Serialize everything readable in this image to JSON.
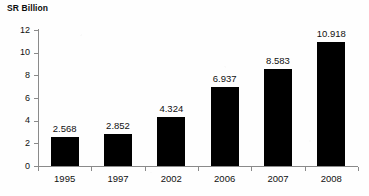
{
  "chart_data": {
    "type": "bar",
    "title": "SR Billion",
    "xlabel": "",
    "ylabel": "SR Billion",
    "categories": [
      "1995",
      "1997",
      "2002",
      "2006",
      "2007",
      "2008"
    ],
    "values": [
      2.568,
      2.852,
      4.324,
      6.937,
      8.583,
      10.918
    ],
    "value_labels": [
      "2.568",
      "2.852",
      "4.324",
      "6.937",
      "8.583",
      "10.918"
    ],
    "ylim": [
      0,
      12
    ],
    "ytick_labels": [
      "0",
      "2",
      "4",
      "6",
      "8",
      "10",
      "12"
    ],
    "ytick_values": [
      0,
      2,
      4,
      6,
      8,
      10,
      12
    ],
    "grid": false,
    "legend": false,
    "legend_position": "none",
    "bar_color": "#000000",
    "axis_color": "#8a8a8a",
    "text_color": "#111111",
    "background_color": "#ffffff"
  }
}
